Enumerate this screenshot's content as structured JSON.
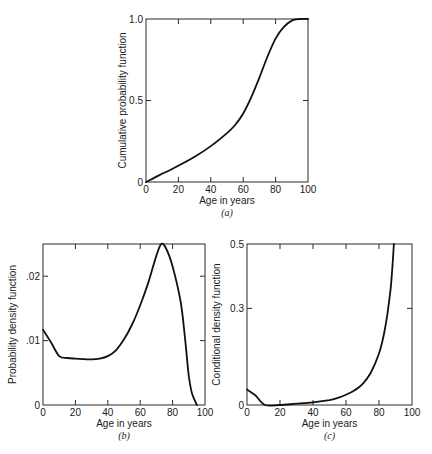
{
  "chart_data": [
    {
      "id": "a",
      "type": "line",
      "title": "",
      "caption": "(a)",
      "xlabel": "Age in years",
      "ylabel": "Cumulative probability function",
      "xlim": [
        0,
        100
      ],
      "ylim": [
        0,
        1.0
      ],
      "xticks": [
        0,
        20,
        40,
        60,
        80,
        100
      ],
      "xtick_labels": [
        "0",
        "20",
        "40",
        "60",
        "80",
        "100"
      ],
      "yticks": [
        0,
        0.5,
        1.0
      ],
      "ytick_labels": [
        "0",
        "0.5",
        "1.0"
      ],
      "grid": false,
      "frame_px": {
        "left": 146,
        "top": 19,
        "right": 308,
        "bottom": 182
      },
      "series": [
        {
          "name": "CDF",
          "x": [
            0,
            5,
            10,
            20,
            30,
            40,
            50,
            55,
            60,
            65,
            70,
            75,
            80,
            85,
            90,
            95,
            100
          ],
          "y": [
            0,
            0.025,
            0.05,
            0.1,
            0.155,
            0.22,
            0.3,
            0.35,
            0.42,
            0.52,
            0.64,
            0.77,
            0.88,
            0.95,
            0.99,
            1.0,
            1.0
          ]
        }
      ]
    },
    {
      "id": "b",
      "type": "line",
      "title": "",
      "caption": "(b)",
      "xlabel": "Age in years",
      "ylabel": "Probability density function",
      "xlim": [
        0,
        100
      ],
      "ylim": [
        0,
        0.025
      ],
      "xticks": [
        0,
        20,
        40,
        60,
        80,
        100
      ],
      "xtick_labels": [
        "0",
        "20",
        "40",
        "60",
        "80",
        "100"
      ],
      "yticks": [
        0,
        0.01,
        0.02
      ],
      "ytick_labels": [
        "0",
        ".01",
        ".02"
      ],
      "grid": false,
      "frame_px": {
        "left": 43,
        "top": 244,
        "right": 205,
        "bottom": 405
      },
      "series": [
        {
          "name": "PDF",
          "x": [
            0,
            5,
            10,
            15,
            20,
            30,
            35,
            40,
            45,
            50,
            55,
            60,
            65,
            70,
            73,
            76,
            80,
            85,
            88,
            90,
            92,
            95
          ],
          "y": [
            0.0117,
            0.0097,
            0.0076,
            0.0073,
            0.0072,
            0.0071,
            0.0072,
            0.0076,
            0.0085,
            0.0102,
            0.0125,
            0.0155,
            0.019,
            0.0232,
            0.025,
            0.0243,
            0.0215,
            0.016,
            0.0095,
            0.0045,
            0.0018,
            0
          ]
        }
      ]
    },
    {
      "id": "c",
      "type": "line",
      "title": "",
      "caption": "(c)",
      "xlabel": "Age in years",
      "ylabel": "Conditional density function",
      "xlim": [
        0,
        100
      ],
      "ylim": [
        0,
        0.5
      ],
      "xticks": [
        0,
        20,
        40,
        60,
        80,
        100
      ],
      "xtick_labels": [
        "0",
        "20",
        "40",
        "60",
        "80",
        "100"
      ],
      "yticks": [
        0,
        0.3,
        0.5
      ],
      "ytick_labels": [
        "0",
        "0.3",
        "0.5"
      ],
      "grid": false,
      "frame_px": {
        "left": 247,
        "top": 244,
        "right": 412,
        "bottom": 405
      },
      "series": [
        {
          "name": "Hazard",
          "x": [
            0,
            5,
            11,
            20,
            30,
            40,
            50,
            55,
            60,
            65,
            70,
            75,
            80,
            83,
            85,
            87,
            88,
            89
          ],
          "y": [
            0.048,
            0.03,
            0.0,
            0.0,
            0.004,
            0.008,
            0.015,
            0.022,
            0.032,
            0.045,
            0.065,
            0.1,
            0.16,
            0.22,
            0.28,
            0.36,
            0.42,
            0.5
          ]
        }
      ]
    }
  ]
}
